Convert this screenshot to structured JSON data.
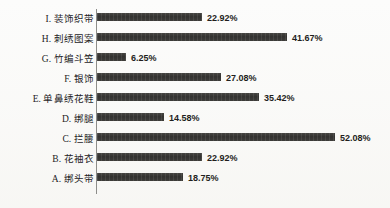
{
  "chart_data": {
    "type": "bar",
    "orientation": "horizontal",
    "title": "",
    "subtitle": "",
    "xlabel": "",
    "ylabel": "",
    "grid": false,
    "legend": null,
    "xlim": [
      0,
      57
    ],
    "value_suffix": "%",
    "categories": [
      "I. 装饰织带",
      "H. 刺绣图案",
      "G. 竹编斗笠",
      "F. 银饰",
      "E. 单鼻绣花鞋",
      "D. 绑腿",
      "C. 拦腰",
      "B. 花袖衣",
      "A. 绑头带"
    ],
    "values": [
      22.92,
      41.67,
      6.25,
      27.08,
      35.42,
      14.58,
      52.08,
      22.92,
      18.75
    ],
    "value_labels": [
      "22.92%",
      "41.67%",
      "6.25%",
      "27.08%",
      "35.42%",
      "14.58%",
      "52.08%",
      "22.92%",
      "18.75%"
    ],
    "series": [
      {
        "name": "占比",
        "values": [
          22.92,
          41.67,
          6.25,
          27.08,
          35.42,
          14.58,
          52.08,
          22.92,
          18.75
        ]
      }
    ],
    "bar_color": "#3c3b39"
  },
  "rows": [
    {
      "label": "I. 装饰织带",
      "value": 22.92,
      "value_label": "22.92%"
    },
    {
      "label": "H. 刺绣图案",
      "value": 41.67,
      "value_label": "41.67%"
    },
    {
      "label": "G. 竹编斗笠",
      "value": 6.25,
      "value_label": "6.25%"
    },
    {
      "label": "F. 银饰",
      "value": 27.08,
      "value_label": "27.08%"
    },
    {
      "label": "E. 单鼻绣花鞋",
      "value": 35.42,
      "value_label": "35.42%"
    },
    {
      "label": "D. 绑腿",
      "value": 14.58,
      "value_label": "14.58%"
    },
    {
      "label": "C. 拦腰",
      "value": 52.08,
      "value_label": "52.08%"
    },
    {
      "label": "B. 花袖衣",
      "value": 22.92,
      "value_label": "22.92%"
    },
    {
      "label": "A. 绑头带",
      "value": 18.75,
      "value_label": "18.75%"
    }
  ],
  "geometry": {
    "axis_x": 96,
    "bar_start_x": 97,
    "px_per_percent": 4.57,
    "first_row_y": 9,
    "row_step": 20,
    "bar_height": 8,
    "label_gap": 5
  }
}
